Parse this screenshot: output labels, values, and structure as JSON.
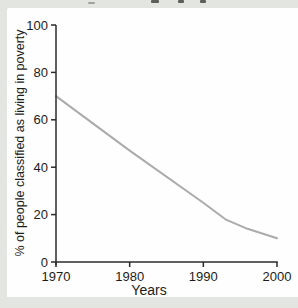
{
  "figure": {
    "surround_color": "#e3e5e0",
    "panel_color": "#fefefe",
    "text_color": "#1c1c1c"
  },
  "chart_data": {
    "type": "line",
    "x": [
      1970,
      1980,
      1990,
      1993,
      1996,
      2000
    ],
    "values": [
      70,
      47,
      25,
      18,
      14,
      10
    ],
    "title": "",
    "xlabel": "Years",
    "ylabel": "% of people classified as living in poverty",
    "xlim": [
      1970,
      2000
    ],
    "ylim": [
      0,
      100
    ],
    "x_ticks": [
      "1970",
      "1980",
      "1990",
      "2000"
    ],
    "y_ticks": [
      "0",
      "20",
      "40",
      "60",
      "80",
      "100"
    ],
    "grid": false,
    "legend": false,
    "line_color": "#ababab",
    "axis_color": "#2b2b2b"
  }
}
